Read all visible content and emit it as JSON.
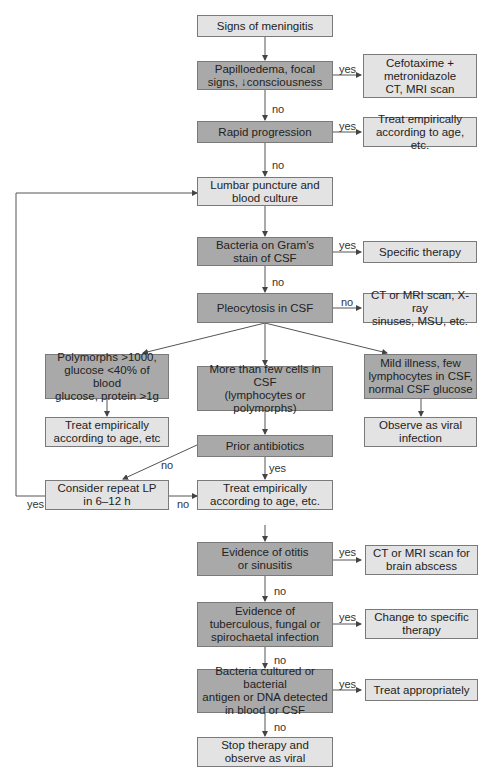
{
  "colors": {
    "decision_fill": "#a9a9a9",
    "action_fill": "#e3e3e3",
    "line": "#555555",
    "border": "#7a7a7a"
  },
  "nodes": {
    "signs": "Signs of meningitis",
    "papilloedema": "Papilloedema, focal\nsigns, ↓consciousness",
    "cefotaxime": "Cefotaxime +\nmetronidazole\nCT, MRI scan",
    "rapid": "Rapid progression",
    "treat_rapid": "Treat empirically\naccording to age, etc.",
    "lumbar": "Lumbar puncture and\nblood culture",
    "gram": "Bacteria on Gram’s\nstain of CSF",
    "specific": "Specific therapy",
    "pleocytosis": "Pleocytosis in CSF",
    "ct_xray": "CT or MRI scan, X-ray\nsinuses, MSU, etc.",
    "polymorphs": "Polymorphs >1000,\nglucose <40% of blood\nglucose, protein >1g",
    "more_cells": "More than few cells in CSF\n(lymphocytes or\npolymorphs)",
    "mild": "Mild illness, few\nlymphocytes in CSF,\nnormal CSF glucose",
    "treat_poly": "Treat empirically\naccording to age, etc",
    "observe_viral": "Observe as viral\ninfection",
    "prior": "Prior antibiotics",
    "repeat_lp": "Consider repeat LP\nin 6–12 h",
    "treat_main": "Treat empirically\naccording to age, etc.",
    "otitis": "Evidence of otitis\nor sinusitis",
    "brain_abscess": "CT or MRI scan for\nbrain abscess",
    "tb": "Evidence of\ntuberculous, fungal or\nspirochaetal infection",
    "change": "Change to specific\ntherapy",
    "cultured": "Bacteria cultured or bacterial\nantigen or DNA detected\nin blood or CSF",
    "treat_appropriately": "Treat appropriately",
    "stop": "Stop therapy and\nobserve as viral"
  },
  "edge_labels": {
    "yes": "yes",
    "no": "no"
  }
}
